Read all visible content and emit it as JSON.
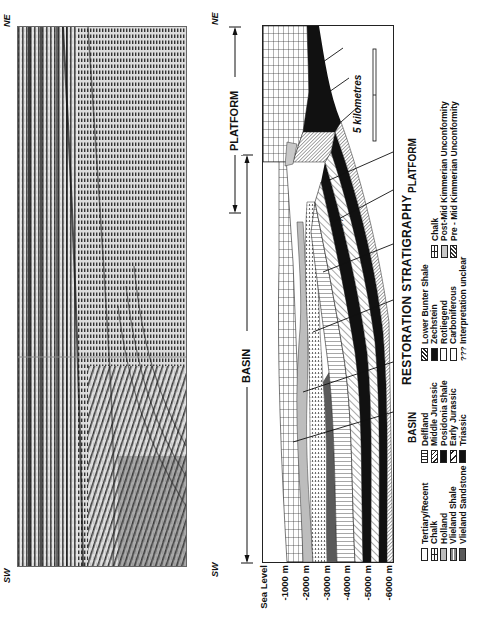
{
  "figure": {
    "orientation": "rotated 90 degrees counter-clockwise",
    "seismic_panel": {
      "left_label": "SW",
      "right_label": "NE"
    },
    "cross_section": {
      "left_label": "SW",
      "right_label": "NE",
      "domains": [
        {
          "label": "BASIN",
          "extent": "SW margin to basin/platform boundary"
        },
        {
          "label": "PLATFORM",
          "extent": "overlapping arrow near NE end to NE margin"
        }
      ],
      "scale_bar": "5 kilometres",
      "depth_axis": {
        "ticks": [
          "Sea Level",
          "-1000 m",
          "-2000 m",
          "-3000 m",
          "-4000 m",
          "-5000 m",
          "-6000 m"
        ]
      }
    },
    "legend": {
      "title": "RESTORATION STRATIGRAPHY",
      "general": [
        {
          "label": "Tertiary/Recent",
          "pattern": "plain"
        },
        {
          "label": "Chalk",
          "pattern": "chalk"
        },
        {
          "label": "Holland",
          "pattern": "holland"
        },
        {
          "label": "Vlieland Shale",
          "pattern": "vshale"
        },
        {
          "label": "Vlieland Sandstone",
          "pattern": "vsand"
        }
      ],
      "basin": {
        "title": "BASIN",
        "items": [
          {
            "label": "Delfland",
            "pattern": "delfland"
          },
          {
            "label": "Middle Jurassic",
            "pattern": "midjur"
          },
          {
            "label": "Posidonia Shale",
            "pattern": "black"
          },
          {
            "label": "Early Jurassic",
            "pattern": "earlyjur"
          },
          {
            "label": "Triassic",
            "pattern": "black"
          }
        ]
      },
      "basin_lower": {
        "items": [
          {
            "label": "Lower Bunter Shale",
            "pattern": "lbs"
          },
          {
            "label": "Zechstein",
            "pattern": "black"
          },
          {
            "label": "Rotliegend",
            "pattern": "plain"
          },
          {
            "label": "Carboniferous",
            "pattern": "plain"
          },
          {
            "label": "Interpretation unclear",
            "pattern": "q",
            "symbol": "???"
          }
        ]
      },
      "platform": {
        "title": "PLATFORM",
        "items": [
          {
            "label": "Chalk",
            "pattern": "chalk"
          },
          {
            "label": "Post-Mid Kimmerian Unconformity",
            "pattern": "postmk"
          },
          {
            "label": "Pre - Mid Kimmerian Unconformity",
            "pattern": "premk"
          }
        ]
      }
    },
    "in_section_annotation": "???"
  }
}
